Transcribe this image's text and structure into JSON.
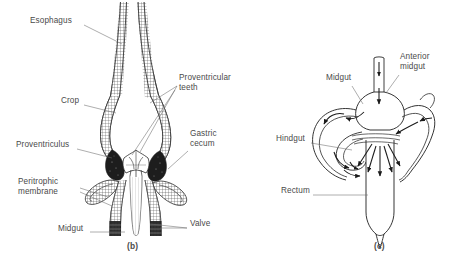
{
  "figure": {
    "background_color": "#ffffff",
    "ink_color": "#3a3a3a",
    "panels": [
      {
        "id": "panel-b",
        "caption": "(b)",
        "caption_x": 127,
        "caption_y": 246,
        "description": "Longitudinal section of insect foregut showing esophagus, crop, proventriculus with proventricular teeth, gastric ceca, peritrophic membrane, valve and midgut",
        "labels": [
          {
            "name": "esophagus",
            "text": "Esophagus",
            "x": 30,
            "y": 21,
            "align": "left",
            "leader": [
              [
                84,
                26
              ],
              [
                122,
                44
              ]
            ]
          },
          {
            "name": "crop",
            "text": "Crop",
            "x": 61,
            "y": 101,
            "align": "left",
            "leader": [
              [
                84,
                106
              ],
              [
                116,
                113
              ]
            ]
          },
          {
            "name": "proventricular-teeth",
            "text": "Proventricular\nteeth",
            "x": 179,
            "y": 78,
            "align": "left",
            "leader": [
              [
                177,
                87
              ],
              [
                147,
                105
              ]
            ]
          },
          {
            "name": "proventriculus",
            "text": "Proventriculus",
            "x": 16,
            "y": 145,
            "align": "left",
            "leader": [
              [
                77,
                150
              ],
              [
                113,
                158
              ]
            ]
          },
          {
            "name": "gastric-cecum",
            "text": "Gastric\ncecum",
            "x": 190,
            "y": 134,
            "align": "left",
            "leader": [
              [
                188,
                152
              ],
              [
                168,
                168
              ]
            ]
          },
          {
            "name": "peritrophic-membrane",
            "text": "Peritrophic\nmembrane",
            "x": 18,
            "y": 182,
            "align": "left",
            "leader": [
              [
                80,
                189
              ],
              [
                107,
                198
              ]
            ]
          },
          {
            "name": "midgut-b",
            "text": "Midgut",
            "x": 58,
            "y": 229,
            "align": "left",
            "leader": [
              [
                90,
                233
              ],
              [
                125,
                233
              ]
            ]
          },
          {
            "name": "valve",
            "text": "Valve",
            "x": 190,
            "y": 224,
            "align": "left",
            "leader": [
              [
                188,
                228
              ],
              [
                160,
                228
              ]
            ]
          }
        ]
      },
      {
        "id": "panel-c",
        "caption": "(c)",
        "caption_x": 374,
        "caption_y": 246,
        "description": "Schematic of insect gut fluid circulation showing anterior midgut, midgut, hindgut and rectum with flow arrows",
        "labels": [
          {
            "name": "midgut-c",
            "text": "Midgut",
            "x": 326,
            "y": 78,
            "align": "left",
            "leader": [
              [
                352,
                87
              ],
              [
                362,
                103
              ]
            ]
          },
          {
            "name": "anterior-midgut",
            "text": "Anterior\nmidgut",
            "x": 400,
            "y": 57,
            "align": "left",
            "leader": [
              [
                399,
                76
              ],
              [
                385,
                92
              ]
            ]
          },
          {
            "name": "hindgut",
            "text": "Hindgut",
            "x": 276,
            "y": 139,
            "align": "left",
            "leader": [
              [
                311,
                143
              ],
              [
                352,
                150
              ]
            ]
          },
          {
            "name": "rectum",
            "text": "Rectum",
            "x": 281,
            "y": 191,
            "align": "left",
            "leader": [
              [
                313,
                195
              ],
              [
                368,
                195
              ]
            ]
          }
        ]
      }
    ]
  }
}
